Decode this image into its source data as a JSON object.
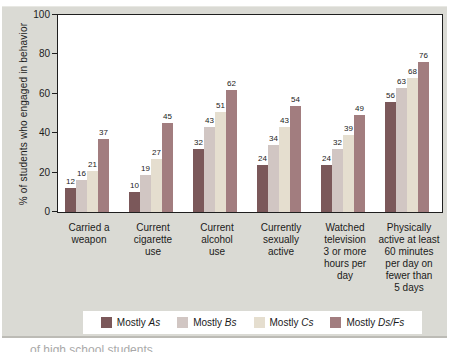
{
  "figure": {
    "ylabel": "% of students who engaged in behavior",
    "caption_fragment": "of high school students"
  },
  "colors": {
    "panel_background": "#dadad4",
    "plot_background": "#ffffff",
    "axis": "#1f1f1f",
    "legend_background": "#ffffff"
  },
  "chart_data": {
    "type": "bar",
    "title": "",
    "xlabel": "",
    "ylabel": "% of students who engaged in behavior",
    "ylim": [
      0,
      100
    ],
    "yticks": [
      0,
      20,
      40,
      60,
      80,
      100
    ],
    "grid": false,
    "legend_position": "bottom",
    "categories": [
      "Carried a\nweapon",
      "Current\ncigarette\nuse",
      "Current\nalcohol\nuse",
      "Currently\nsexually\nactive",
      "Watched\ntelevision\n3 or more\nhours per\nday",
      "Physically\nactive at least\n60 minutes\nper day on\nfewer than\n5 days"
    ],
    "series": [
      {
        "name": "Mostly As",
        "color": "#7b585a",
        "values": [
          12,
          10,
          32,
          24,
          24,
          56
        ]
      },
      {
        "name": "Mostly Bs",
        "color": "#d1c6c3",
        "values": [
          16,
          19,
          43,
          34,
          32,
          63
        ]
      },
      {
        "name": "Mostly Cs",
        "color": "#e5decf",
        "values": [
          21,
          27,
          51,
          43,
          39,
          68
        ]
      },
      {
        "name": "Mostly Ds/Fs",
        "color": "#a27d7f",
        "values": [
          37,
          45,
          62,
          54,
          49,
          76
        ]
      }
    ],
    "legend_items": [
      {
        "parts": [
          {
            "t": "Mostly ",
            "i": false
          },
          {
            "t": "As",
            "i": true
          }
        ]
      },
      {
        "parts": [
          {
            "t": "Mostly ",
            "i": false
          },
          {
            "t": "Bs",
            "i": true
          }
        ]
      },
      {
        "parts": [
          {
            "t": "Mostly ",
            "i": false
          },
          {
            "t": "Cs",
            "i": true
          }
        ]
      },
      {
        "parts": [
          {
            "t": "Mostly ",
            "i": false
          },
          {
            "t": "Ds/Fs",
            "i": true
          }
        ]
      }
    ]
  }
}
